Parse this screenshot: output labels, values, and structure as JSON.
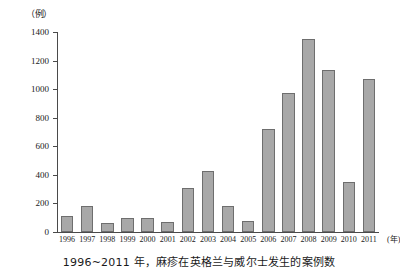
{
  "chart_data": {
    "type": "bar",
    "title": "",
    "caption": "1996~2011 年，麻疹在英格兰与威尔士发生的案例数",
    "xlabel": "",
    "ylabel": "",
    "x_unit": "(年)",
    "y_unit": "（例）",
    "categories": [
      "1996",
      "1997",
      "1998",
      "1999",
      "2000",
      "2001",
      "2002",
      "2003",
      "2004",
      "2005",
      "2006",
      "2007",
      "2008",
      "2009",
      "2010",
      "2011"
    ],
    "values": [
      115,
      180,
      60,
      95,
      100,
      70,
      310,
      425,
      185,
      75,
      720,
      970,
      1350,
      1135,
      350,
      1070
    ],
    "ylim": [
      0,
      1400
    ],
    "y_ticks": [
      0,
      200,
      400,
      600,
      800,
      1000,
      1200,
      1400
    ],
    "grid": false,
    "legend": "none",
    "bar_color": "#a8a8a8",
    "bar_border_color": "#6e6e6e",
    "axis_color": "#4a4a4a"
  }
}
